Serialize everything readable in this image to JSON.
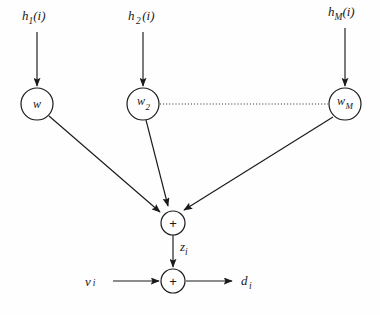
{
  "diagram": {
    "background_color": "#fefefe",
    "stroke_color": "#1a1a1a",
    "inputs": [
      {
        "id": "h1",
        "base": "h",
        "sub": "1",
        "arg": "(i)"
      },
      {
        "id": "h2",
        "base": "h",
        "sub": "2",
        "arg": "(i)"
      },
      {
        "id": "hM",
        "base": "h",
        "sub": "M",
        "arg": "(i)"
      }
    ],
    "weights": [
      {
        "id": "w1",
        "base": "w",
        "sub": ""
      },
      {
        "id": "w2",
        "base": "w",
        "sub": "2"
      },
      {
        "id": "wM",
        "base": "w",
        "sub": "M"
      }
    ],
    "adders": [
      {
        "id": "sum-top",
        "glyph": "+"
      },
      {
        "id": "sum-bottom",
        "glyph": "+"
      }
    ],
    "signals": {
      "intermediate": {
        "base": "z",
        "sub": "i"
      },
      "noise": {
        "base": "v",
        "sub": "i"
      },
      "output": {
        "base": "d",
        "sub": "i"
      }
    },
    "ellipsis_connector": "dotted-line"
  }
}
